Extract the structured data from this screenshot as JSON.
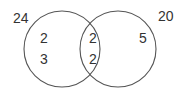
{
  "diagram": {
    "type": "venn",
    "stroke_color": "#555555",
    "text_color": "#333333",
    "sets": [
      {
        "name": "left-set",
        "total_label": "24",
        "circle": {
          "cx": 62,
          "cy": 49,
          "r": 38
        },
        "label_pos": {
          "x": 13,
          "y": 23
        }
      },
      {
        "name": "right-set",
        "total_label": "20",
        "circle": {
          "cx": 118,
          "cy": 49,
          "r": 38
        },
        "label_pos": {
          "x": 158,
          "y": 21
        }
      }
    ],
    "regions": {
      "left_only": [
        {
          "value": "2",
          "x": 40,
          "y": 43
        },
        {
          "value": "3",
          "x": 40,
          "y": 64
        }
      ],
      "intersection": [
        {
          "value": "2",
          "x": 89,
          "y": 43
        },
        {
          "value": "2",
          "x": 89,
          "y": 64
        }
      ],
      "right_only": [
        {
          "value": "5",
          "x": 139,
          "y": 43
        }
      ]
    }
  }
}
